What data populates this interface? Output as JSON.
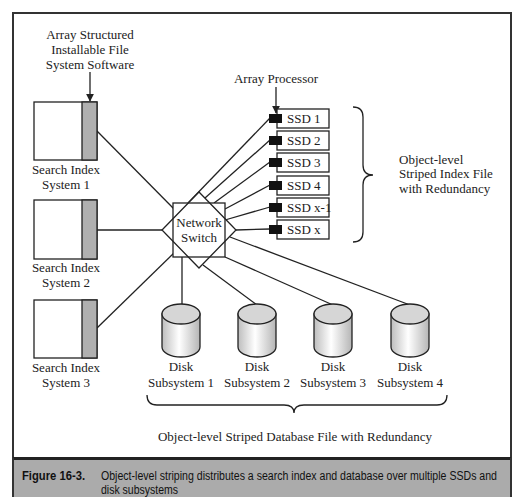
{
  "figure": {
    "software_label": [
      "Array Structured",
      "Installable File",
      "System Software"
    ],
    "array_processor_label": "Array Processor",
    "search_index_systems": [
      {
        "line1": "Search Index",
        "line2": "System 1"
      },
      {
        "line1": "Search Index",
        "line2": "System 2"
      },
      {
        "line1": "Search Index",
        "line2": "System 3"
      }
    ],
    "network_switch": [
      "Network",
      "Switch"
    ],
    "ssds": [
      "SSD 1",
      "SSD 2",
      "SSD 3",
      "SSD 4",
      "SSD x-1",
      "SSD x"
    ],
    "index_file_label": [
      "Object-level",
      "Striped Index File",
      "with Redundancy"
    ],
    "disk_subsystems": [
      {
        "line1": "Disk",
        "line2": "Subsystem 1"
      },
      {
        "line1": "Disk",
        "line2": "Subsystem 2"
      },
      {
        "line1": "Disk",
        "line2": "Subsystem 3"
      },
      {
        "line1": "Disk",
        "line2": "Subsystem 4"
      }
    ],
    "database_file_label": "Object-level Striped Database File with Redundancy"
  },
  "caption": {
    "number": "Figure 16-3.",
    "text_line1": "Object-level striping distributes a search index and database over multiple SSDs and",
    "text_line2": "disk subsystems"
  },
  "colors": {
    "frame": "#333333",
    "caption_background": "#ababab",
    "software_strip": "#b0b0b0",
    "connector": "#111111"
  }
}
